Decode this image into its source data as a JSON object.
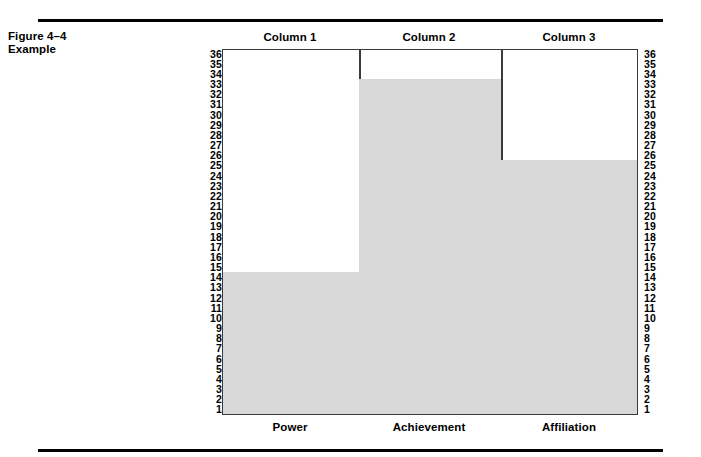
{
  "figure": {
    "caption_line1": "Figure 4–4",
    "caption_line2": "Example"
  },
  "columns": [
    {
      "header": "Column 1",
      "label": "Power"
    },
    {
      "header": "Column 2",
      "label": "Achievement"
    },
    {
      "header": "Column 3",
      "label": "Affiliation"
    }
  ],
  "chart_data": {
    "type": "bar",
    "title": "Figure 4–4 Example",
    "categories": [
      "Power",
      "Achievement",
      "Affiliation"
    ],
    "column_headers": [
      "Column 1",
      "Column 2",
      "Column 3"
    ],
    "values": [
      14,
      33,
      25
    ],
    "xlabel": "",
    "ylabel": "",
    "ylim": [
      1,
      36
    ],
    "y_ticks": [
      36,
      35,
      34,
      33,
      32,
      31,
      30,
      29,
      28,
      27,
      26,
      25,
      24,
      23,
      22,
      21,
      20,
      19,
      18,
      17,
      16,
      15,
      14,
      13,
      12,
      11,
      10,
      9,
      8,
      7,
      6,
      5,
      4,
      3,
      2,
      1
    ],
    "dual_axis": true,
    "grid": false,
    "legend": "none",
    "bar_color": "#d8d8d8",
    "frame_color": "#3a3a3a"
  }
}
